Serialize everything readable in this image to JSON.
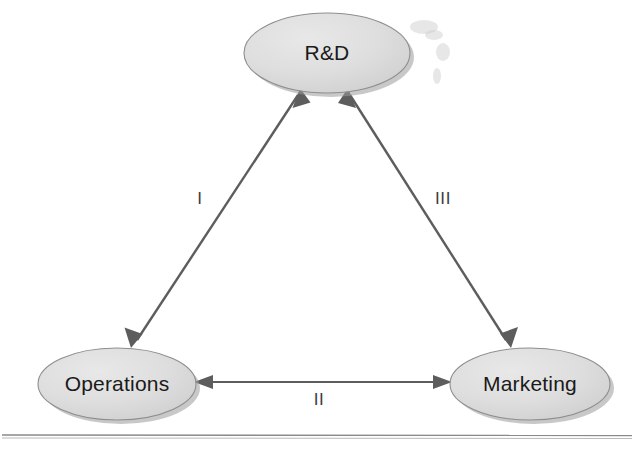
{
  "diagram": {
    "background_color": "#ffffff",
    "node_fill_color": "#dcdcdc",
    "node_border_color": "#8e8e8e",
    "edge_color": "#5d5d5d",
    "label_color": "#1a1a1a",
    "nodes": [
      {
        "id": "rd",
        "label": "R&D",
        "cx": 327,
        "cy": 53,
        "rx": 83,
        "ry": 40
      },
      {
        "id": "operations",
        "label": "Operations",
        "cx": 117,
        "cy": 384,
        "rx": 79,
        "ry": 36
      },
      {
        "id": "marketing",
        "label": "Marketing",
        "cx": 530,
        "cy": 384,
        "rx": 80,
        "ry": 36
      }
    ],
    "edges": [
      {
        "id": "edge-i",
        "label": "I",
        "from": "operations",
        "to": "rd",
        "direction": "bidirectional",
        "label_x": 200,
        "label_y": 200
      },
      {
        "id": "edge-ii",
        "label": "II",
        "from": "operations",
        "to": "marketing",
        "direction": "bidirectional",
        "label_x": 319,
        "label_y": 401
      },
      {
        "id": "edge-iii",
        "label": "III",
        "from": "marketing",
        "to": "rd",
        "direction": "bidirectional",
        "label_x": 443,
        "label_y": 200
      }
    ],
    "footer_rule": {
      "y": 436,
      "x_start": 2,
      "x_end": 632
    }
  }
}
